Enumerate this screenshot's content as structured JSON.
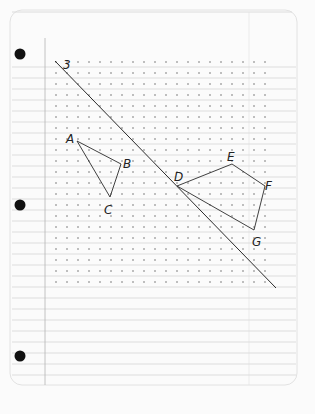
{
  "paper": {
    "background": "#fbfbfb",
    "rule_color": "#c9c9c9",
    "dot_color": "#555555",
    "ink_color": "#2a2a2a",
    "hole_punches": [
      {
        "x": 20,
        "y": 54
      },
      {
        "x": 20,
        "y": 205
      },
      {
        "x": 20,
        "y": 356
      }
    ],
    "margin_x": 45,
    "grid": {
      "x0": 56,
      "y0": 62,
      "cols": 20,
      "rows": 21,
      "spacing": 11
    }
  },
  "line": {
    "label": "3",
    "from": {
      "x": 55,
      "y": 61
    },
    "to": {
      "x": 276,
      "y": 288
    }
  },
  "triangle_abc": {
    "vertices": [
      {
        "name": "A",
        "x": 77,
        "y": 141,
        "lx": 66,
        "ly": 143
      },
      {
        "name": "B",
        "x": 121,
        "y": 164,
        "lx": 123,
        "ly": 168
      },
      {
        "name": "C",
        "x": 110,
        "y": 197,
        "lx": 104,
        "ly": 214
      }
    ]
  },
  "quadrilateral_defg": {
    "vertices": [
      {
        "name": "D",
        "x": 177,
        "y": 186,
        "lx": 174,
        "ly": 181
      },
      {
        "name": "E",
        "x": 232,
        "y": 164,
        "lx": 227,
        "ly": 161
      },
      {
        "name": "F",
        "x": 265,
        "y": 186,
        "lx": 265,
        "ly": 190
      },
      {
        "name": "G",
        "x": 254,
        "y": 230,
        "lx": 252,
        "ly": 246
      }
    ]
  }
}
